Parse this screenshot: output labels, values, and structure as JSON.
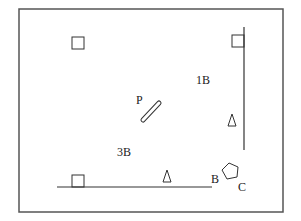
{
  "diagram": {
    "frame": {
      "x": 19,
      "y": 9,
      "width": 264,
      "height": 203,
      "stroke": "#555555"
    },
    "walls": [
      {
        "id": "right-wall",
        "x1": 244,
        "y1": 27,
        "x2": 244,
        "y2": 150
      },
      {
        "id": "bottom-wall",
        "x1": 57,
        "y1": 187,
        "x2": 212,
        "y2": 187
      }
    ],
    "squares": [
      {
        "id": "square-top-left",
        "x": 72,
        "y": 37,
        "size": 12
      },
      {
        "id": "square-top-right",
        "x": 232,
        "y": 35,
        "size": 12
      },
      {
        "id": "square-bottom",
        "x": 72,
        "y": 175,
        "size": 12
      }
    ],
    "triangles": [
      {
        "id": "triangle-right",
        "points": "232,114 228,126 236,126"
      },
      {
        "id": "triangle-bottom",
        "points": "167,170 163,182 171,182"
      }
    ],
    "rod": {
      "id": "rod-P",
      "x1": 143,
      "y1": 120,
      "x2": 159,
      "y2": 103,
      "width": 4
    },
    "pentagon": {
      "id": "pentagon",
      "points": "229,163 238,167 237,177 227,179 222,170"
    },
    "labels": [
      {
        "id": "label-1B",
        "text": "1B",
        "x": 196,
        "y": 84
      },
      {
        "id": "label-P",
        "text": "P",
        "x": 136,
        "y": 104
      },
      {
        "id": "label-3B",
        "text": "3B",
        "x": 117,
        "y": 156
      },
      {
        "id": "label-B",
        "text": "B",
        "x": 211,
        "y": 183
      },
      {
        "id": "label-C",
        "text": "C",
        "x": 238,
        "y": 190
      }
    ],
    "stroke_color": "#333333"
  }
}
